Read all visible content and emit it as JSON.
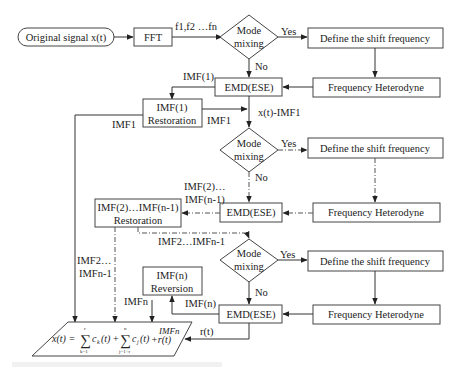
{
  "diagram": {
    "start": "Original signal x(t)",
    "fft": "FFT",
    "fft_out": "f1,f2 …fn",
    "mode_mixing": [
      "Mode",
      "mixing"
    ],
    "yes": "Yes",
    "no": "No",
    "define_shift": "Define the shift frequency",
    "freq_heterodyne": "Frequency Heterodyne",
    "emd": "EMD(ESE)",
    "stage1": {
      "imf_label": "IMF(1)",
      "restoration": [
        "IMF(1)",
        "Restoration"
      ],
      "imf1_right": "IMF1",
      "imf1_left": "IMF1",
      "residual": "x(t)-IMF1"
    },
    "stage2": {
      "imf_label": [
        "IMF(2)…",
        "IMF(n-1)"
      ],
      "restoration": [
        "IMF(2)…IMF(n-1)",
        "Restoration"
      ],
      "imf_out": "IMF2…IMFn-1",
      "imf_left": [
        "IMF2…",
        "IMFn-1"
      ]
    },
    "stage3": {
      "imf_label": "IMF(n)",
      "reversion": [
        "IMF(n)",
        "Reversion"
      ],
      "imfn": "IMFn",
      "residual": "r(t)"
    },
    "result": {
      "lhs": "x(t) =",
      "sum1_top": "r",
      "sum1_bottom": "k=1",
      "term1": "c",
      "term1_sub": "k",
      "sum2_top": "n",
      "sum2_bottom": "j=1+r",
      "term2": "c",
      "term2_sub": "j",
      "tail": "+r(t)",
      "imfn_note": "IMFn",
      "arg": "(t)",
      "plus": "+"
    }
  }
}
